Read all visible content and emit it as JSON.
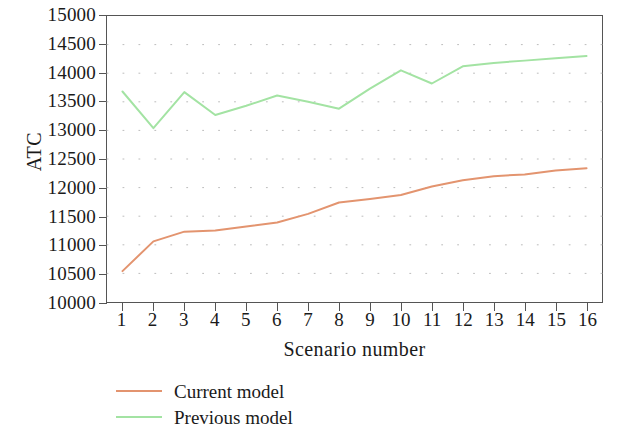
{
  "chart_data": {
    "type": "line",
    "title": "",
    "xlabel": "Scenario number",
    "ylabel": "ATC",
    "x": [
      1,
      2,
      3,
      4,
      5,
      6,
      7,
      8,
      9,
      10,
      11,
      12,
      13,
      14,
      15,
      16
    ],
    "xticklabels": [
      "1",
      "2",
      "3",
      "4",
      "5",
      "6",
      "7",
      "8",
      "9",
      "10",
      "11",
      "12",
      "13",
      "14",
      "15",
      "16"
    ],
    "xlim": [
      0.5,
      16.5
    ],
    "ylim": [
      10000,
      15000
    ],
    "yticks": [
      10000,
      10500,
      11000,
      11500,
      12000,
      12500,
      13000,
      13500,
      14000,
      14500,
      15000
    ],
    "yticklabels": [
      "10000",
      "10500",
      "11000",
      "11500",
      "12000",
      "12500",
      "13000",
      "13500",
      "14000",
      "14500",
      "15000"
    ],
    "grid": "dotted-horizontal-and-vertical-minor",
    "legend_position": "below-axes-left",
    "series": [
      {
        "name": "Current model",
        "color": "#e3946f",
        "values": [
          10540,
          11060,
          11230,
          11250,
          11320,
          11390,
          11540,
          11740,
          11800,
          11870,
          12020,
          12130,
          12200,
          12230,
          12300,
          12340
        ]
      },
      {
        "name": "Previous model",
        "color": "#a3e3a3",
        "values": [
          13680,
          13040,
          13670,
          13270,
          13430,
          13610,
          13500,
          13380,
          13730,
          14050,
          13820,
          14120,
          14180,
          14220,
          14260,
          14300
        ]
      }
    ]
  },
  "axes": {
    "y_title": "ATC",
    "x_title": "Scenario number"
  },
  "colors": {
    "current_model": "#e3946f",
    "previous_model": "#a3e3a3",
    "axis": "#555555",
    "grid": "#bbbbbb",
    "background": "#ffffff"
  }
}
